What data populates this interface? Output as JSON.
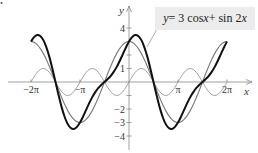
{
  "chart_data": {
    "type": "line",
    "title": "",
    "xlabel": "x",
    "ylabel": "y",
    "xlim": [
      -6.2832,
      7.2
    ],
    "ylim": [
      -4.5,
      4.8
    ],
    "grid": false,
    "legend_position": "top-right",
    "x_ticks": [
      {
        "value": -6.2832,
        "label": "−2π"
      },
      {
        "value": -3.1416,
        "label": "−π"
      },
      {
        "value": 3.1416,
        "label": "π"
      },
      {
        "value": 6.2832,
        "label": "2π"
      }
    ],
    "y_ticks": [
      {
        "value": 4,
        "label": "4"
      },
      {
        "value": 3,
        "label": ""
      },
      {
        "value": 2,
        "label": ""
      },
      {
        "value": 1,
        "label": "1"
      },
      {
        "value": -1,
        "label": ""
      },
      {
        "value": -2,
        "label": "−2"
      },
      {
        "value": -3,
        "label": "−3"
      },
      {
        "value": -4,
        "label": "−4"
      }
    ],
    "x_step": "π/16",
    "x_start": -6.2832,
    "annotation": "y = 3 cos x + sin 2x",
    "series": [
      {
        "name": "y = 3 cos x",
        "style": "medium-gray",
        "color": "#7a7a7a",
        "values": [
          3,
          2.94,
          2.77,
          2.49,
          2.12,
          1.67,
          1.15,
          0.59,
          0,
          -0.59,
          -1.15,
          -1.67,
          -2.12,
          -2.49,
          -2.77,
          -2.94,
          -3,
          -2.94,
          -2.77,
          -2.49,
          -2.12,
          -1.67,
          -1.15,
          -0.59,
          0,
          0.59,
          1.15,
          1.67,
          2.12,
          2.49,
          2.77,
          2.94,
          3,
          2.94,
          2.77,
          2.49,
          2.12,
          1.67,
          1.15,
          0.59,
          0,
          -0.59,
          -1.15,
          -1.67,
          -2.12,
          -2.49,
          -2.77,
          -2.94,
          -3,
          -2.94,
          -2.77,
          -2.49,
          -2.12,
          -1.67,
          -1.15,
          -0.59,
          0,
          0.59,
          1.15,
          1.67,
          2.12,
          2.49,
          2.77,
          2.94,
          3
        ]
      },
      {
        "name": "y = sin 2x",
        "style": "thin-gray",
        "color": "#8a8a8a",
        "values": [
          0,
          0.383,
          0.707,
          0.924,
          1,
          0.924,
          0.707,
          0.383,
          0,
          -0.383,
          -0.707,
          -0.924,
          -1,
          -0.924,
          -0.707,
          -0.383,
          0,
          0.383,
          0.707,
          0.924,
          1,
          0.924,
          0.707,
          0.383,
          0,
          -0.383,
          -0.707,
          -0.924,
          -1,
          -0.924,
          -0.707,
          -0.383,
          0,
          0.383,
          0.707,
          0.924,
          1,
          0.924,
          0.707,
          0.383,
          0,
          -0.383,
          -0.707,
          -0.924,
          -1,
          -0.924,
          -0.707,
          -0.383,
          0,
          0.383,
          0.707,
          0.924,
          1,
          0.924,
          0.707,
          0.383,
          0,
          -0.383,
          -0.707,
          -0.924,
          -1,
          -0.924,
          -0.707,
          -0.383,
          0
        ]
      },
      {
        "name": "y = 3 cos x + sin 2x",
        "style": "thick-black",
        "color": "#111111",
        "values": [
          3,
          3.32,
          3.48,
          3.41,
          3.12,
          2.59,
          1.86,
          0.97,
          0,
          -0.97,
          -1.86,
          -2.59,
          -3.12,
          -3.41,
          -3.48,
          -3.32,
          -3,
          -2.56,
          -2.06,
          -1.57,
          -1.12,
          -0.75,
          -0.44,
          -0.21,
          0,
          0.21,
          0.44,
          0.75,
          1.12,
          1.57,
          2.06,
          2.56,
          3,
          3.32,
          3.48,
          3.41,
          3.12,
          2.59,
          1.86,
          0.97,
          0,
          -0.97,
          -1.86,
          -2.59,
          -3.12,
          -3.41,
          -3.48,
          -3.32,
          -3,
          -2.56,
          -2.06,
          -1.57,
          -1.12,
          -0.75,
          -0.44,
          -0.21,
          0,
          0.21,
          0.44,
          0.75,
          1.12,
          1.57,
          2.06,
          2.56,
          3
        ]
      }
    ]
  },
  "legend": {
    "lhs": "y",
    "rhs_1": " = 3 cos ",
    "var_1": "x",
    "rhs_2": " + sin 2",
    "var_2": "x"
  },
  "axes": {
    "x_label": "x",
    "y_label": "y"
  }
}
